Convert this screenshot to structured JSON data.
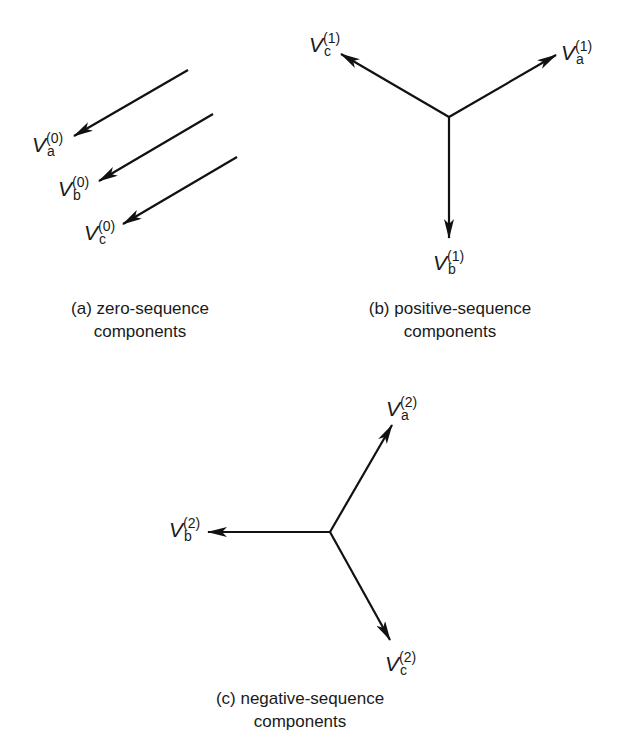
{
  "diagram": {
    "panels": [
      {
        "id": "a",
        "caption_line1": "(a) zero-sequence",
        "caption_line2": "components",
        "phasors": [
          {
            "name": "V",
            "sub": "a",
            "sup": "(0)"
          },
          {
            "name": "V",
            "sub": "b",
            "sup": "(0)"
          },
          {
            "name": "V",
            "sub": "c",
            "sup": "(0)"
          }
        ]
      },
      {
        "id": "b",
        "caption_line1": "(b) positive-sequence",
        "caption_line2": "components",
        "phasors": [
          {
            "name": "V",
            "sub": "a",
            "sup": "(1)"
          },
          {
            "name": "V",
            "sub": "b",
            "sup": "(1)"
          },
          {
            "name": "V",
            "sub": "c",
            "sup": "(1)"
          }
        ]
      },
      {
        "id": "c",
        "caption_line1": "(c) negative-sequence",
        "caption_line2": "components",
        "phasors": [
          {
            "name": "V",
            "sub": "a",
            "sup": "(2)"
          },
          {
            "name": "V",
            "sub": "b",
            "sup": "(2)"
          },
          {
            "name": "V",
            "sub": "c",
            "sup": "(2)"
          }
        ]
      }
    ],
    "colors": {
      "stroke": "#111111",
      "background": "#ffffff"
    }
  }
}
